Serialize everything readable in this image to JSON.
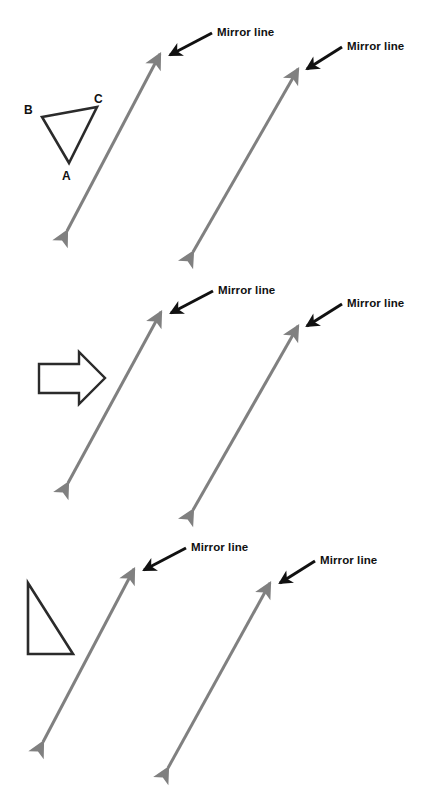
{
  "page": {
    "background_color": "#ffffff",
    "width": 432,
    "height": 787
  },
  "colors": {
    "mirror_line": "#808080",
    "pointer_arrow": "#111111",
    "shape_outline": "#2b2b2b",
    "label_text": "#111111"
  },
  "labels": {
    "mirror_line": "Mirror line",
    "vertex_a": "A",
    "vertex_b": "B",
    "vertex_c": "C"
  },
  "panels": [
    {
      "id": "panel-1",
      "shape": {
        "type": "triangle",
        "name": "labelled-triangle-abc",
        "points": "42,117 97,107 69,163",
        "vertex_labels": [
          {
            "key": "vertex_b",
            "x": 24,
            "y": 114
          },
          {
            "key": "vertex_c",
            "x": 94,
            "y": 103
          },
          {
            "key": "vertex_a",
            "x": 62,
            "y": 180
          }
        ]
      },
      "mirror_lines": [
        {
          "name": "mirror-line-left",
          "x1": 67,
          "y1": 231,
          "x2": 160,
          "y2": 54,
          "label": {
            "x": 217,
            "y": 36
          },
          "pointer": {
            "x1": 212,
            "y1": 33,
            "x2": 168,
            "y2": 55
          }
        },
        {
          "name": "mirror-line-right",
          "x1": 193,
          "y1": 252,
          "x2": 298,
          "y2": 69,
          "label": {
            "x": 347,
            "y": 50
          },
          "pointer": {
            "x1": 342,
            "y1": 47,
            "x2": 305,
            "y2": 69
          }
        }
      ]
    },
    {
      "id": "panel-2",
      "shape": {
        "type": "block-arrow",
        "name": "right-pointing-block-arrow",
        "points": "39,364 79,364 79,352 105,378 79,404 79,393 39,393"
      },
      "mirror_lines": [
        {
          "name": "mirror-line-left",
          "x1": 68,
          "y1": 483,
          "x2": 161,
          "y2": 312,
          "label": {
            "x": 218,
            "y": 294
          },
          "pointer": {
            "x1": 213,
            "y1": 291,
            "x2": 169,
            "y2": 313
          }
        },
        {
          "name": "mirror-line-right",
          "x1": 193,
          "y1": 510,
          "x2": 298,
          "y2": 326,
          "label": {
            "x": 347,
            "y": 307
          },
          "pointer": {
            "x1": 342,
            "y1": 304,
            "x2": 305,
            "y2": 326
          }
        }
      ]
    },
    {
      "id": "panel-3",
      "shape": {
        "type": "right-triangle",
        "name": "right-angled-triangle",
        "points": "28,583 28,654 73,654"
      },
      "mirror_lines": [
        {
          "name": "mirror-line-left",
          "x1": 43,
          "y1": 742,
          "x2": 134,
          "y2": 569,
          "label": {
            "x": 191,
            "y": 551
          },
          "pointer": {
            "x1": 186,
            "y1": 548,
            "x2": 142,
            "y2": 570
          }
        },
        {
          "name": "mirror-line-right",
          "x1": 168,
          "y1": 768,
          "x2": 270,
          "y2": 583,
          "label": {
            "x": 320,
            "y": 564
          },
          "pointer": {
            "x1": 315,
            "y1": 561,
            "x2": 278,
            "y2": 583
          }
        }
      ]
    }
  ]
}
